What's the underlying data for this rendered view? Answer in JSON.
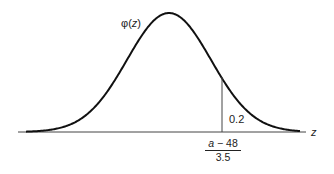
{
  "chart_data": {
    "type": "line",
    "title": "",
    "curve_label": "φ(z)",
    "xlabel": "z",
    "ylabel": "",
    "series": [
      {
        "name": "φ(z)",
        "shape": "normal-density",
        "mean": 0,
        "sd": 1
      }
    ],
    "annotations": [
      {
        "type": "vline",
        "x_label_numerator": "a − 48",
        "x_label_denominator": "3.5"
      },
      {
        "type": "area-label",
        "text": "0.2",
        "region": "right tail"
      }
    ],
    "grid": false,
    "legend": "none"
  },
  "labels": {
    "phi_prefix": "φ(",
    "phi_var": "z",
    "phi_suffix": ")",
    "axis_var": "z",
    "tail_area": "0.2",
    "cut_numerator_var": "a",
    "cut_numerator_rest": " − 48",
    "cut_denominator": "3.5"
  }
}
